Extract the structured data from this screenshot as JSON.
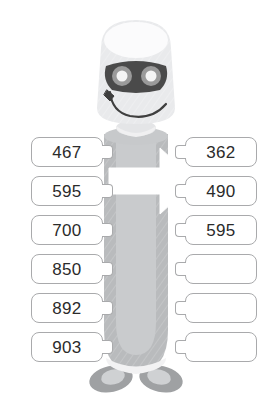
{
  "worksheet": {
    "title": "Number ordering robot worksheet",
    "background_color": "#ffffff",
    "box_border_color": "#a9aaac",
    "text_color": "#2b2b2b"
  },
  "mascot": {
    "name": "robot-mascot",
    "body_color": "#b9bbbd",
    "body_inner_color": "#c9cbcd",
    "head_color": "#e9eaec",
    "head_top_color": "#fbfbfc",
    "mask_color": "#4a4a4a",
    "eye_ring_color": "#9a9a9a",
    "eye_center_color": "#f4f4f4",
    "foot_color": "#9fa1a3",
    "arrow_color": "#ffffff",
    "arrow_direction": "right"
  },
  "left_column": {
    "name": "left-number-column",
    "items": [
      {
        "value": "467",
        "empty": false
      },
      {
        "value": "595",
        "empty": false
      },
      {
        "value": "700",
        "empty": false
      },
      {
        "value": "850",
        "empty": false
      },
      {
        "value": "892",
        "empty": false
      },
      {
        "value": "903",
        "empty": false
      }
    ]
  },
  "right_column": {
    "name": "right-number-column",
    "items": [
      {
        "value": "362",
        "empty": false
      },
      {
        "value": "490",
        "empty": false
      },
      {
        "value": "595",
        "empty": false
      },
      {
        "value": "",
        "empty": true
      },
      {
        "value": "",
        "empty": true
      },
      {
        "value": "",
        "empty": true
      }
    ]
  }
}
